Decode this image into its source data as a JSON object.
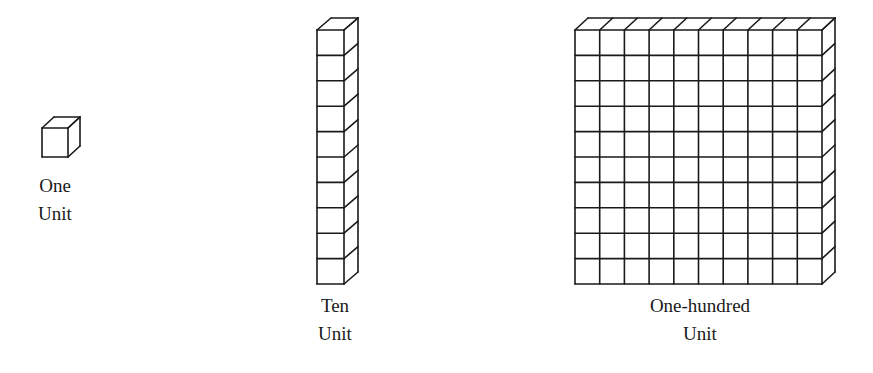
{
  "diagram": {
    "type": "base-ten blocks",
    "blocks": [
      {
        "name": "one",
        "label_lines": [
          "One",
          "Unit"
        ],
        "cubes": 1
      },
      {
        "name": "ten",
        "label_lines": [
          "Ten",
          "Unit"
        ],
        "cubes": 10
      },
      {
        "name": "hundred",
        "label_lines": [
          "One-hundred",
          "Unit"
        ],
        "cubes": 100
      }
    ],
    "stroke_color": "#1a1a1a",
    "background": "#ffffff"
  }
}
